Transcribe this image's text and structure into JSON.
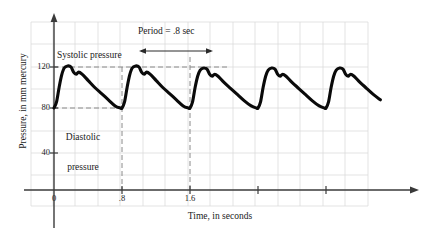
{
  "chart_data": {
    "type": "line",
    "title": "",
    "xlabel": "Time, in seconds",
    "ylabel": "Pressure, in mm mercury",
    "xlim": [
      0,
      4.32
    ],
    "ylim": [
      0,
      150
    ],
    "grid": true,
    "legend": "none",
    "x_ticks": [
      {
        "value": 0,
        "label": "0"
      },
      {
        "value": 0.8,
        "label": ".8"
      },
      {
        "value": 1.6,
        "label": "1.6"
      },
      {
        "value": 2.4,
        "label": ""
      },
      {
        "value": 3.2,
        "label": ""
      }
    ],
    "y_ticks": [
      {
        "value": 40,
        "label": "40"
      },
      {
        "value": 80,
        "label": "80"
      },
      {
        "value": 120,
        "label": "120"
      }
    ],
    "series": [
      {
        "name": "arterial blood pressure",
        "period": 0.8,
        "systolic": 120,
        "diastolic": 80,
        "cycles": 5,
        "points": [
          [
            0.0,
            80
          ],
          [
            0.03,
            86
          ],
          [
            0.06,
            100
          ],
          [
            0.09,
            112
          ],
          [
            0.12,
            119
          ],
          [
            0.16,
            121
          ],
          [
            0.2,
            120
          ],
          [
            0.23,
            115
          ],
          [
            0.26,
            113
          ],
          [
            0.29,
            115
          ],
          [
            0.33,
            113
          ],
          [
            0.4,
            107
          ],
          [
            0.48,
            100
          ],
          [
            0.56,
            94
          ],
          [
            0.64,
            88
          ],
          [
            0.72,
            82
          ],
          [
            0.78,
            80
          ],
          [
            0.8,
            80
          ],
          [
            0.83,
            86
          ],
          [
            0.86,
            100
          ],
          [
            0.89,
            112
          ],
          [
            0.92,
            119
          ],
          [
            0.96,
            121
          ],
          [
            1.0,
            120
          ],
          [
            1.03,
            115
          ],
          [
            1.06,
            113
          ],
          [
            1.09,
            115
          ],
          [
            1.13,
            113
          ],
          [
            1.2,
            107
          ],
          [
            1.28,
            100
          ],
          [
            1.36,
            94
          ],
          [
            1.44,
            88
          ],
          [
            1.52,
            82
          ],
          [
            1.58,
            80
          ],
          [
            1.6,
            80
          ],
          [
            1.63,
            86
          ],
          [
            1.66,
            100
          ],
          [
            1.69,
            111
          ],
          [
            1.72,
            117
          ],
          [
            1.76,
            119
          ],
          [
            1.8,
            118
          ],
          [
            1.83,
            113
          ],
          [
            1.86,
            111
          ],
          [
            1.89,
            113
          ],
          [
            1.93,
            111
          ],
          [
            2.0,
            105
          ],
          [
            2.08,
            99
          ],
          [
            2.16,
            93
          ],
          [
            2.24,
            87
          ],
          [
            2.32,
            82
          ],
          [
            2.38,
            80
          ],
          [
            2.4,
            80
          ],
          [
            2.43,
            86
          ],
          [
            2.46,
            100
          ],
          [
            2.49,
            111
          ],
          [
            2.52,
            117
          ],
          [
            2.56,
            119
          ],
          [
            2.6,
            118
          ],
          [
            2.63,
            113
          ],
          [
            2.66,
            111
          ],
          [
            2.69,
            113
          ],
          [
            2.73,
            111
          ],
          [
            2.8,
            105
          ],
          [
            2.88,
            99
          ],
          [
            2.96,
            93
          ],
          [
            3.04,
            87
          ],
          [
            3.12,
            82
          ],
          [
            3.18,
            80
          ],
          [
            3.2,
            80
          ],
          [
            3.23,
            86
          ],
          [
            3.26,
            100
          ],
          [
            3.29,
            111
          ],
          [
            3.32,
            117
          ],
          [
            3.36,
            119
          ],
          [
            3.4,
            118
          ],
          [
            3.43,
            113
          ],
          [
            3.46,
            111
          ],
          [
            3.49,
            113
          ],
          [
            3.53,
            111
          ],
          [
            3.6,
            105
          ],
          [
            3.68,
            99
          ],
          [
            3.76,
            93
          ],
          [
            3.84,
            88
          ]
        ]
      }
    ],
    "reference_lines": [
      {
        "name": "systolic",
        "orientation": "horizontal",
        "value": 120,
        "style": "dashed"
      },
      {
        "name": "diastolic",
        "orientation": "horizontal",
        "value": 80,
        "style": "dashed"
      },
      {
        "name": "cycle-start",
        "orientation": "vertical",
        "value": 0.8,
        "style": "dashed"
      },
      {
        "name": "cycle-end",
        "orientation": "vertical",
        "value": 1.6,
        "style": "dashed"
      }
    ],
    "annotations": [
      {
        "name": "systolic-pressure",
        "text": "Systolic pressure"
      },
      {
        "name": "diastolic-pressure",
        "text": "Diastolic pressure"
      },
      {
        "name": "period",
        "text": "Period = .8 sec",
        "from": 0.8,
        "to": 1.6
      }
    ],
    "colors": {
      "curve": "#000000",
      "axis": "#333333",
      "grid": "#d8d8d8",
      "dashed": "#8a8a8a",
      "text": "#1a1a1a"
    }
  },
  "labels": {
    "ylabel": "Pressure, in mm mercury",
    "xlabel": "Time, in seconds",
    "systolic": "Systolic pressure",
    "diastolic_line1": "Diastolic",
    "diastolic_line2": "pressure",
    "diastolic": "Diastolic\npressure",
    "period": "Period = .8 sec",
    "y1": "40",
    "y2": "80",
    "y3": "120",
    "x0": "0",
    "x1": ".8",
    "x2": "1.6"
  }
}
